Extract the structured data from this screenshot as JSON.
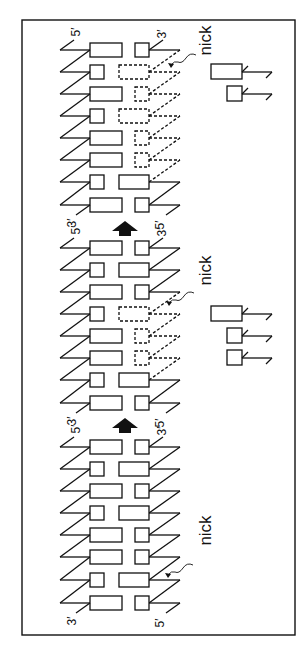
{
  "figure": {
    "stroke_color": "#111111",
    "background": "#ffffff"
  },
  "frame": {
    "x": 22,
    "y": 20,
    "w": 273,
    "h": 615
  },
  "labels": {
    "five_prime": "5′",
    "three_prime": "3′",
    "nick": "nick"
  },
  "sections": [
    {
      "id": "section-1",
      "end_labels": {
        "top_left": "5′",
        "top_right": "3′",
        "bottom_left": "3′",
        "bottom_right": "5′"
      },
      "rows": [
        {
          "y": 50,
          "left": "long",
          "right": "small",
          "right_style": "solid"
        },
        {
          "y": 72,
          "left": "small",
          "right": "long",
          "right_style": "dashed"
        },
        {
          "y": 94,
          "left": "long",
          "right": "small",
          "right_style": "dashed"
        },
        {
          "y": 116,
          "left": "small",
          "right": "long",
          "right_style": "dashed"
        },
        {
          "y": 138,
          "left": "long",
          "right": "small",
          "right_style": "dashed"
        },
        {
          "y": 160,
          "left": "long",
          "right": "small",
          "right_style": "dashed"
        },
        {
          "y": 182,
          "left": "small",
          "right": "long",
          "right_style": "solid"
        },
        {
          "y": 205,
          "left": "long",
          "right": "small",
          "right_style": "solid"
        }
      ],
      "nick": {
        "label": "nick",
        "label_x": 205,
        "label_y": 40,
        "arrow_tip_x": 168,
        "arrow_tip_y": 63
      },
      "released_fragments": [
        {
          "y": 72,
          "size": "long"
        },
        {
          "y": 94,
          "size": "small"
        }
      ]
    },
    {
      "id": "section-2",
      "end_labels": {
        "top_left": "5′",
        "top_right": "3′",
        "bottom_left": "3′",
        "bottom_right": "5′"
      },
      "rows": [
        {
          "y": 248,
          "left": "long",
          "right": "small",
          "right_style": "solid"
        },
        {
          "y": 270,
          "left": "small",
          "right": "long",
          "right_style": "solid"
        },
        {
          "y": 292,
          "left": "long",
          "right": "small",
          "right_style": "solid"
        },
        {
          "y": 314,
          "left": "small",
          "right": "long",
          "right_style": "dashed"
        },
        {
          "y": 336,
          "left": "long",
          "right": "small",
          "right_style": "dashed"
        },
        {
          "y": 358,
          "left": "long",
          "right": "small",
          "right_style": "dashed"
        },
        {
          "y": 380,
          "left": "small",
          "right": "long",
          "right_style": "solid"
        },
        {
          "y": 403,
          "left": "long",
          "right": "small",
          "right_style": "solid"
        }
      ],
      "nick": {
        "label": "nick",
        "label_x": 205,
        "label_y": 270,
        "arrow_tip_x": 166,
        "arrow_tip_y": 301
      },
      "released_fragments": [
        {
          "y": 314,
          "size": "long"
        },
        {
          "y": 336,
          "size": "small"
        },
        {
          "y": 358,
          "size": "small"
        }
      ]
    },
    {
      "id": "section-3",
      "end_labels": {
        "top_left": "5′",
        "top_right": "3′",
        "bottom_left": "3′",
        "bottom_right": "5′"
      },
      "rows": [
        {
          "y": 447,
          "left": "long",
          "right": "small",
          "right_style": "solid"
        },
        {
          "y": 469,
          "left": "small",
          "right": "long",
          "right_style": "solid"
        },
        {
          "y": 491,
          "left": "long",
          "right": "small",
          "right_style": "solid"
        },
        {
          "y": 513,
          "left": "small",
          "right": "long",
          "right_style": "solid"
        },
        {
          "y": 535,
          "left": "long",
          "right": "small",
          "right_style": "solid"
        },
        {
          "y": 557,
          "left": "long",
          "right": "small",
          "right_style": "solid"
        },
        {
          "y": 580,
          "left": "small",
          "right": "long",
          "right_style": "solid"
        },
        {
          "y": 603,
          "left": "long",
          "right": "small",
          "right_style": "solid"
        }
      ],
      "nick": {
        "label": "nick",
        "label_x": 205,
        "label_y": 530,
        "arrow_tip_x": 165,
        "arrow_tip_y": 573
      },
      "released_fragments": []
    }
  ],
  "transition_arrows": [
    {
      "x": 125,
      "y": 228,
      "direction": "up"
    },
    {
      "x": 125,
      "y": 425,
      "direction": "up"
    }
  ]
}
